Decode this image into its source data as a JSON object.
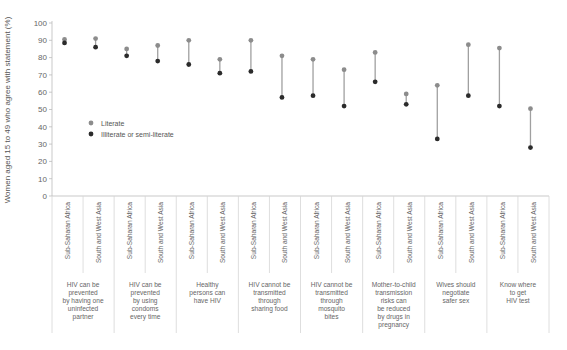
{
  "chart_data": {
    "type": "dumbbell",
    "title": "",
    "ylabel": "Women aged 15 to 49 who agree with statement (%)",
    "xlabel": "",
    "ylim": [
      0,
      100
    ],
    "yticks": [
      0,
      10,
      20,
      30,
      40,
      50,
      60,
      70,
      80,
      90,
      100
    ],
    "grid": false,
    "legend_position": "inside-left",
    "legend": [
      {
        "name": "Literate",
        "color": "#8c8c8c"
      },
      {
        "name": "Illiterate or semi-literate",
        "color": "#2b2b2b"
      }
    ],
    "regions": [
      "Sub-Saharan Africa",
      "South and West Asia"
    ],
    "groups": [
      {
        "label": "HIV can be prevented by having one uninfected partner",
        "label_lines": [
          "HIV can be",
          "prevented",
          "by having one",
          "uninfected",
          "partner"
        ],
        "literate": [
          90.5,
          91
        ],
        "illiterate": [
          88.5,
          86
        ]
      },
      {
        "label": "HIV can be prevented by using condoms every time",
        "label_lines": [
          "HIV can be",
          "prevented",
          "by using",
          "condoms",
          "every time"
        ],
        "literate": [
          85,
          87
        ],
        "illiterate": [
          81,
          78
        ]
      },
      {
        "label": "Healthy persons can have HIV",
        "label_lines": [
          "Healthy",
          "persons can",
          "have HIV"
        ],
        "literate": [
          90,
          79
        ],
        "illiterate": [
          76,
          71
        ]
      },
      {
        "label": "HIV cannot be transmitted through sharing food",
        "label_lines": [
          "HIV cannot be",
          "transmitted",
          "through",
          "sharing food"
        ],
        "literate": [
          90,
          81
        ],
        "illiterate": [
          72,
          57
        ]
      },
      {
        "label": "HIV cannot be transmitted through mosquito bites",
        "label_lines": [
          "HIV cannot be",
          "transmitted",
          "through",
          "mosquito",
          "bites"
        ],
        "literate": [
          79,
          73
        ],
        "illiterate": [
          58,
          52
        ]
      },
      {
        "label": "Mother-to-child transmission risks can be reduced by drugs in pregnancy",
        "label_lines": [
          "Mother-to-child",
          "transmission",
          "risks can",
          "be reduced",
          "by drugs in",
          "pregnancy"
        ],
        "literate": [
          83,
          59
        ],
        "illiterate": [
          66,
          53
        ]
      },
      {
        "label": "Wives should negotiate safer sex",
        "label_lines": [
          "Wives should",
          "negotiate",
          "safer sex"
        ],
        "literate": [
          64,
          87.5
        ],
        "illiterate": [
          33,
          58
        ]
      },
      {
        "label": "Know where to get HIV test",
        "label_lines": [
          "Know where",
          "to get",
          "HIV test"
        ],
        "literate": [
          85.5,
          50.5
        ],
        "illiterate": [
          52,
          28
        ]
      }
    ]
  },
  "colors": {
    "literate": "#8c8c8c",
    "illiterate": "#2b2b2b",
    "connector": "#a0a0a0"
  }
}
